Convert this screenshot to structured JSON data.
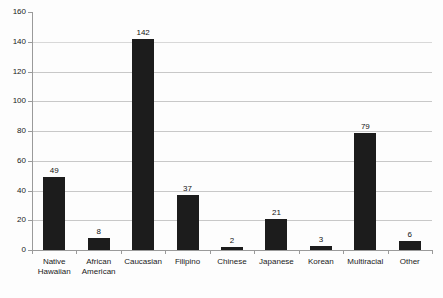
{
  "chart_data": {
    "type": "bar",
    "title": "",
    "subtitle": "",
    "xlabel": "",
    "ylabel": "",
    "ylim": [
      0,
      160
    ],
    "ytick_step": 20,
    "yticks": [
      0,
      20,
      40,
      60,
      80,
      100,
      120,
      140,
      160
    ],
    "grid": true,
    "grid_axis": "y",
    "legend": false,
    "bar_color": "#1c1c1c",
    "categories": [
      "Native Hawaiian",
      "African American",
      "Caucasian",
      "Filipino",
      "Chinese",
      "Japanese",
      "Korean",
      "Multiracial",
      "Other"
    ],
    "category_lines": [
      [
        "Native",
        "Hawaiian"
      ],
      [
        "African",
        "American"
      ],
      [
        "Caucasian"
      ],
      [
        "Filipino"
      ],
      [
        "Chinese"
      ],
      [
        "Japanese"
      ],
      [
        "Korean"
      ],
      [
        "Multiracial"
      ],
      [
        "Other"
      ]
    ],
    "values": [
      49,
      8,
      142,
      37,
      2,
      21,
      3,
      79,
      6
    ],
    "value_labels": [
      "49",
      "8",
      "142",
      "37",
      "2",
      "21",
      "3",
      "79",
      "6"
    ]
  },
  "style": {
    "background": "#fdfdfd",
    "gridline_color": "#c8c8c8",
    "axis_color": "#9a9a9a",
    "text_color": "#1a1a1a"
  }
}
